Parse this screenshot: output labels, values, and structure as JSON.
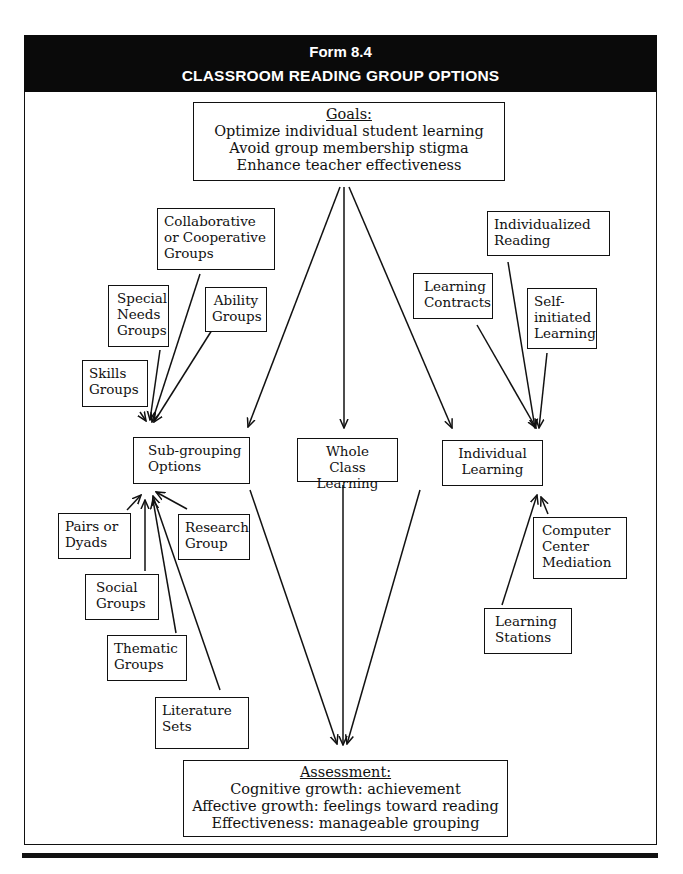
{
  "header": {
    "form_number": "Form 8.4",
    "title": "CLASSROOM READING GROUP OPTIONS"
  },
  "goals": {
    "heading": "Goals:",
    "lines": [
      "Optimize individual student learning",
      "Avoid group membership stigma",
      "Enhance teacher effectiveness"
    ]
  },
  "main_options": {
    "sub_grouping": "Sub-grouping Options",
    "whole_class": "Whole Class Learning",
    "individual": "Individual Learning"
  },
  "sub_grouping_inputs_top": [
    {
      "label": "Collaborative or Cooperative Groups"
    },
    {
      "label": "Special Needs Groups"
    },
    {
      "label": "Ability Groups"
    },
    {
      "label": "Skills Groups"
    }
  ],
  "sub_grouping_inputs_bottom": [
    {
      "label": "Pairs or Dyads"
    },
    {
      "label": "Research Group"
    },
    {
      "label": "Social Groups"
    },
    {
      "label": "Thematic Groups"
    },
    {
      "label": "Literature Sets"
    }
  ],
  "individual_inputs_top": [
    {
      "label": "Individualized Reading"
    },
    {
      "label": "Learning Contracts"
    },
    {
      "label": "Self-initiated Learning"
    }
  ],
  "individual_inputs_bottom": [
    {
      "label": "Computer Center Mediation"
    },
    {
      "label": "Learning Stations"
    }
  ],
  "assessment": {
    "heading": "Assessment:",
    "lines": [
      "Cognitive growth: achievement",
      "Affective growth: feelings toward reading",
      "Effectiveness: manageable grouping"
    ]
  }
}
